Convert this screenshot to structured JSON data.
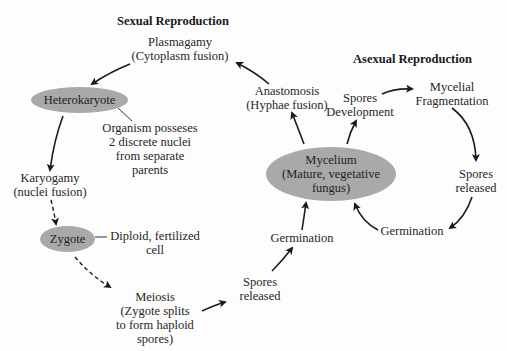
{
  "diagram": {
    "headings": {
      "sexual": "Sexual Reproduction",
      "asexual": "Asexual Reproduction"
    },
    "nodes": {
      "plasmagamy": {
        "line1": "Plasmagamy",
        "line2": "(Cytoplasm fusion)"
      },
      "heterokaryote": {
        "label": "Heterokaryote"
      },
      "heterokaryote_note": {
        "line1": "Organism posseses",
        "line2": "2 discrete nuclei",
        "line3": "from separate",
        "line4": "parents"
      },
      "karyogamy": {
        "line1": "Karyogamy",
        "line2": "(nuclei fusion)"
      },
      "zygote": {
        "label": "Zygote"
      },
      "zygote_note": {
        "line1": "Diploid, fertilized",
        "line2": "cell"
      },
      "meiosis": {
        "line1": "Meiosis",
        "line2": "(Zygote splits",
        "line3": "to form haploid",
        "line4": "spores)"
      },
      "spores_released_sexual": {
        "line1": "Spores",
        "line2": "released"
      },
      "germination_sexual": {
        "label": "Germination"
      },
      "mycelium": {
        "line1": "Mycelium",
        "line2": "(Mature, vegetative",
        "line3": "fungus)"
      },
      "anastomosis": {
        "line1": "Anastomosis",
        "line2": "(Hyphae fusion)"
      },
      "spores_development": {
        "line1": "Spores",
        "line2": "Development"
      },
      "mycelial_fragmentation": {
        "line1": "Mycelial",
        "line2": "Fragmentation"
      },
      "spores_released_asexual": {
        "line1": "Spores",
        "line2": "released"
      },
      "germination_asexual": {
        "label": "Germination"
      }
    },
    "edges": [
      {
        "from": "plasmagamy",
        "to": "heterokaryote",
        "style": "solid"
      },
      {
        "from": "heterokaryote",
        "to": "karyogamy",
        "style": "solid"
      },
      {
        "from": "karyogamy",
        "to": "zygote",
        "style": "dashed"
      },
      {
        "from": "zygote",
        "to": "meiosis",
        "style": "dashed"
      },
      {
        "from": "meiosis",
        "to": "spores_released_sexual",
        "style": "solid"
      },
      {
        "from": "spores_released_sexual",
        "to": "germination_sexual",
        "style": "solid"
      },
      {
        "from": "germination_sexual",
        "to": "mycelium",
        "style": "solid"
      },
      {
        "from": "mycelium",
        "to": "anastomosis",
        "style": "solid"
      },
      {
        "from": "anastomosis",
        "to": "plasmagamy",
        "style": "solid"
      },
      {
        "from": "mycelium",
        "to": "spores_development",
        "style": "solid"
      },
      {
        "from": "spores_development",
        "to": "mycelial_fragmentation",
        "style": "solid"
      },
      {
        "from": "mycelial_fragmentation",
        "to": "spores_released_asexual",
        "style": "solid"
      },
      {
        "from": "spores_released_asexual",
        "to": "germination_asexual",
        "style": "solid"
      },
      {
        "from": "germination_asexual",
        "to": "mycelium",
        "style": "solid"
      }
    ],
    "colors": {
      "ellipse_fill": "#a9a9a9",
      "arrow": "#1a1a1a",
      "text": "#262626"
    }
  }
}
